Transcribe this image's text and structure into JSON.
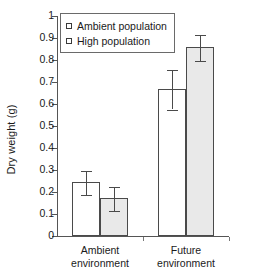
{
  "chart_data": {
    "type": "bar",
    "title": "",
    "xlabel": "",
    "ylabel": "Dry weight (g)",
    "ylim": [
      0,
      1
    ],
    "ytick_labels": [
      "0",
      "0.1",
      "0.2",
      "0.3",
      "0.4",
      "0.5",
      "0.6",
      "0.7",
      "0.8",
      "0.9",
      "1"
    ],
    "ytick_values": [
      0,
      0.1,
      0.2,
      0.3,
      0.4,
      0.5,
      0.6,
      0.7,
      0.8,
      0.9,
      1
    ],
    "grid": false,
    "legend_position": "upper-left-inside",
    "categories": [
      "Ambient environment",
      "Future environment"
    ],
    "category_lines": [
      [
        "Ambient",
        "environment"
      ],
      [
        "Future",
        "environment"
      ]
    ],
    "series": [
      {
        "name": "Ambient population",
        "fill": "#ffffff",
        "values": [
          0.24,
          0.665
        ],
        "errors": [
          0.055,
          0.09
        ]
      },
      {
        "name": "High population",
        "fill": "#e9e9e9",
        "values": [
          0.17,
          0.855
        ],
        "errors": [
          0.055,
          0.058
        ]
      }
    ]
  },
  "legend": {
    "items": [
      {
        "label": "Ambient population",
        "style": "open"
      },
      {
        "label": "High population",
        "style": "filled"
      }
    ]
  },
  "colors": {
    "axis": "#555555",
    "bar_outline": "#4a4a4a",
    "bar_open_fill": "#ffffff",
    "bar_filled_fill": "#e9e9e9",
    "text": "#1a1a1a"
  }
}
